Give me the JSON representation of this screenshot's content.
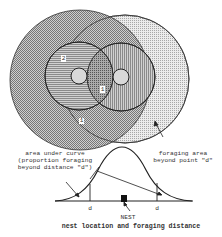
{
  "diagram": {
    "title": "nest location and foraging distance",
    "region_labels": [
      "2",
      "1",
      "1"
    ],
    "annotations": {
      "left_lines": [
        "area under curve",
        "(proportion foraging",
        "beyond distance \"d\")"
      ],
      "right_lines": [
        "foraging area",
        "beyond point \"d\""
      ]
    },
    "axis": {
      "d_left": "d",
      "d_right": "d",
      "nest": "NEST"
    },
    "colors": {
      "line": "#222222",
      "fill_dark": "#9a9a9a",
      "fill_light": "#cfcfcf",
      "nest": "#111111"
    }
  }
}
